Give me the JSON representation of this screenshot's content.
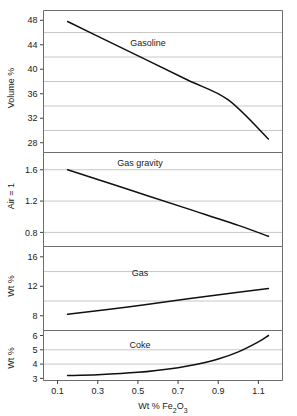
{
  "figure": {
    "x_axis_label": "Wt % Fe2O3",
    "x_axis_label_parts": {
      "pre": "Wt % Fe",
      "sub1": "2",
      "mid": "O",
      "sub2": "3"
    },
    "x_ticks": [
      "0.1",
      "0.3",
      "0.5",
      "0.7",
      "0.9",
      "1.1"
    ],
    "x_tick_values": [
      0.1,
      0.3,
      0.5,
      0.7,
      0.9,
      1.1
    ],
    "x_range": [
      0.03,
      1.22
    ],
    "line_color": "#101010",
    "grid_color": "#b9b9b9",
    "frame_color": "#6d6d6d"
  },
  "chart_data": [
    {
      "type": "line",
      "title": "Gasoline",
      "ylabel": "Volume %",
      "xlabel": "Wt % Fe2O3",
      "ylim": [
        26.4,
        49.6
      ],
      "yticks": [
        48,
        44,
        40,
        36,
        32,
        28
      ],
      "ytick_labels": [
        "48",
        "44",
        "40",
        "36",
        "32",
        "28"
      ],
      "gridlines": [
        46,
        42,
        38,
        34,
        30
      ],
      "grid": true,
      "legend": "none",
      "x": [
        0.15,
        0.3,
        0.5,
        0.7,
        0.9,
        1.05,
        1.15
      ],
      "values": [
        47.8,
        45.6,
        42.7,
        39.7,
        36.7,
        34.5,
        28.6
      ],
      "series": [
        {
          "name": "Gasoline",
          "x": [
            0.15,
            0.35,
            0.55,
            0.75,
            0.95,
            1.15
          ],
          "values": [
            47.8,
            44.6,
            41.4,
            38.2,
            35.0,
            28.6
          ]
        }
      ]
    },
    {
      "type": "line",
      "title": "Gas gravity",
      "ylabel": "Air = 1",
      "xlabel": "Wt % Fe2O3",
      "ylim": [
        0.62,
        1.82
      ],
      "yticks": [
        1.6,
        1.2,
        0.8
      ],
      "ytick_labels": [
        "1.6",
        "1.2",
        "0.8"
      ],
      "gridlines": [
        1.6,
        1.2,
        0.8
      ],
      "grid": true,
      "legend": "none",
      "x": [
        0.15,
        1.15
      ],
      "values": [
        1.6,
        0.75
      ],
      "series": [
        {
          "name": "Gas gravity",
          "x": [
            0.15,
            0.45,
            0.75,
            1.0,
            1.15
          ],
          "values": [
            1.6,
            1.35,
            1.1,
            0.89,
            0.75
          ]
        }
      ]
    },
    {
      "type": "line",
      "title": "Gas",
      "ylabel": "Wt %",
      "xlabel": "Wt % Fe2O3",
      "ylim": [
        6.0,
        17.4
      ],
      "yticks": [
        16,
        12,
        8
      ],
      "ytick_labels": [
        "16",
        "12",
        "8"
      ],
      "gridlines": [
        14,
        10
      ],
      "grid": true,
      "legend": "none",
      "x": [
        0.15,
        1.15
      ],
      "values": [
        8.2,
        11.7
      ],
      "series": [
        {
          "name": "Gas",
          "x": [
            0.15,
            0.45,
            0.75,
            1.0,
            1.15
          ],
          "values": [
            8.2,
            9.2,
            10.3,
            11.2,
            11.7
          ]
        }
      ]
    },
    {
      "type": "line",
      "title": "Coke",
      "ylabel": "Wt %",
      "xlabel": "Wt % Fe2O3",
      "ylim": [
        2.85,
        6.35
      ],
      "yticks": [
        6,
        5,
        4,
        3
      ],
      "ytick_labels": [
        "6",
        "5",
        "4",
        "3"
      ],
      "gridlines": [
        5,
        4
      ],
      "grid": true,
      "legend": "none",
      "x": [
        0.15,
        0.3,
        0.5,
        0.7,
        0.8,
        0.9,
        1.0,
        1.1,
        1.15
      ],
      "values": [
        3.2,
        3.25,
        3.42,
        3.75,
        4.0,
        4.35,
        4.85,
        5.55,
        6.0
      ],
      "series": [
        {
          "name": "Coke",
          "x": [
            0.15,
            0.3,
            0.5,
            0.7,
            0.8,
            0.9,
            1.0,
            1.1,
            1.15
          ],
          "values": [
            3.2,
            3.25,
            3.42,
            3.75,
            4.0,
            4.35,
            4.85,
            5.55,
            6.0
          ]
        }
      ]
    }
  ]
}
